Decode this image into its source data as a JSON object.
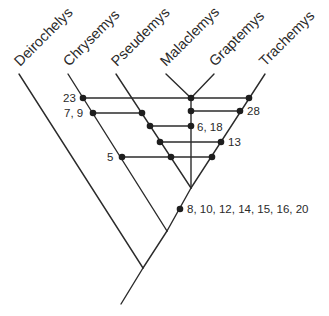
{
  "diagram": {
    "type": "cladogram",
    "colors": {
      "line": "#2b2b2b",
      "dot": "#1e1e1e",
      "background": "#ffffff"
    },
    "taxa": [
      {
        "name": "Deirochelys"
      },
      {
        "name": "Chrysemys"
      },
      {
        "name": "Pseudemys"
      },
      {
        "name": "Malaclemys"
      },
      {
        "name": "Graptemys"
      },
      {
        "name": "Trachemys"
      }
    ],
    "character_labels": [
      {
        "id": "c23",
        "text": "23"
      },
      {
        "id": "c7_9",
        "text": "7, 9"
      },
      {
        "id": "c28",
        "text": "28"
      },
      {
        "id": "c6_18",
        "text": "6, 18"
      },
      {
        "id": "c13",
        "text": "13"
      },
      {
        "id": "c5",
        "text": "5"
      },
      {
        "id": "c8_20",
        "text": "8, 10, 12, 14, 15, 16, 20"
      }
    ]
  }
}
